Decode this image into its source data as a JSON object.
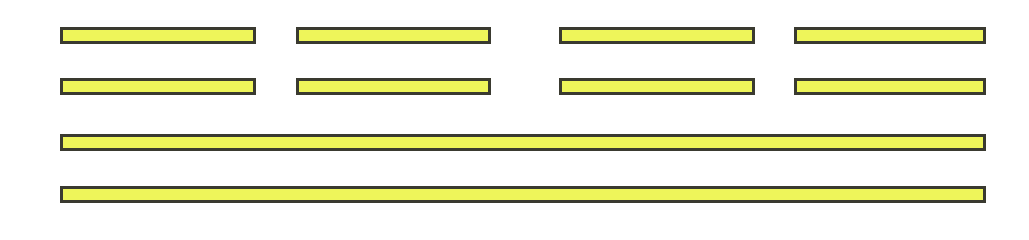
{
  "diagram": {
    "fill_color": "#eef55a",
    "border_color": "#3a3a30",
    "rows": [
      {
        "y": 27,
        "bars": [
          {
            "x": 60,
            "w": 196
          },
          {
            "x": 296,
            "w": 195
          },
          {
            "x": 559,
            "w": 196
          },
          {
            "x": 794,
            "w": 192
          }
        ]
      },
      {
        "y": 78,
        "bars": [
          {
            "x": 60,
            "w": 196
          },
          {
            "x": 296,
            "w": 195
          },
          {
            "x": 559,
            "w": 196
          },
          {
            "x": 794,
            "w": 192
          }
        ]
      },
      {
        "y": 134,
        "bars": [
          {
            "x": 60,
            "w": 926
          }
        ]
      },
      {
        "y": 186,
        "bars": [
          {
            "x": 60,
            "w": 926
          }
        ]
      }
    ]
  }
}
